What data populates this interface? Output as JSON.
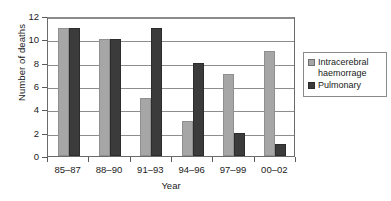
{
  "chart_data": {
    "type": "bar",
    "title": "",
    "xlabel": "Year",
    "ylabel": "Number of deaths",
    "categories": [
      "85–87",
      "88–90",
      "91–93",
      "94–96",
      "97–99",
      "00–02"
    ],
    "series": [
      {
        "name": "Intracerebral haemorrage",
        "color": "#a6a6a6",
        "values": [
          11,
          10,
          5,
          3,
          7,
          9
        ]
      },
      {
        "name": "Pulmonary",
        "color": "#3b3b3b",
        "values": [
          11,
          10,
          11,
          8,
          2,
          1
        ]
      }
    ],
    "ylim": [
      0,
      12
    ],
    "ytick_labels": [
      "0",
      "2",
      "4",
      "6",
      "8",
      "10",
      "12"
    ],
    "ytick_values": [
      0,
      2,
      4,
      6,
      8,
      10,
      12
    ],
    "grid": true,
    "legend_position": "right"
  },
  "legend": {
    "entries": [
      {
        "label_line1": "Intracerebral",
        "label_line2": "haemorrage"
      },
      {
        "label_line1": "Pulmonary",
        "label_line2": ""
      }
    ]
  }
}
